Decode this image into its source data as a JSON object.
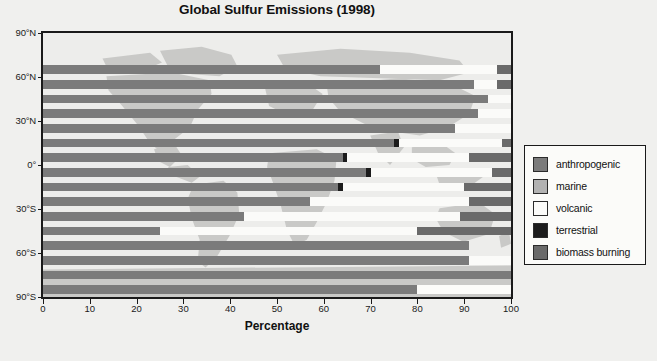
{
  "chart_data": {
    "type": "bar",
    "orientation": "horizontal",
    "stacked": true,
    "title": "Global Sulfur Emissions (1998)",
    "xlabel": "Percentage",
    "ylabel": "",
    "xlim": [
      0,
      100
    ],
    "grid": false,
    "legend_position": "right",
    "xticks": [
      "0",
      "10",
      "20",
      "30",
      "40",
      "50",
      "60",
      "70",
      "80",
      "90",
      "100"
    ],
    "xtick_values": [
      0,
      10,
      20,
      30,
      40,
      50,
      60,
      70,
      80,
      90,
      100
    ],
    "yticks": [
      "90°N",
      "60°N",
      "30°N",
      "0°",
      "30°S",
      "60°S",
      "90°S"
    ],
    "ytick_values": [
      90,
      60,
      30,
      0,
      -30,
      -60,
      -90
    ],
    "categories": [
      "80-90°N",
      "70-80°N",
      "60-70°N",
      "50-60°N",
      "40-50°N",
      "30-40°N",
      "20-30°N",
      "10-20°N",
      "0-10°N",
      "0-10°S",
      "10-20°S",
      "20-30°S",
      "30-40°S",
      "40-50°S",
      "50-60°S",
      "60-70°S",
      "70-80°S",
      "80-90°S"
    ],
    "series": [
      {
        "name": "anthropogenic",
        "color": "#7b7b7b",
        "values": [
          0,
          0,
          72,
          92,
          95,
          93,
          88,
          75,
          64,
          69,
          63,
          57,
          43,
          25,
          0,
          0,
          0,
          0
        ]
      },
      {
        "name": "marine",
        "color": "#b2b2b2",
        "values": [
          0,
          0,
          0,
          0,
          0,
          0,
          0,
          0,
          0,
          0,
          0,
          0,
          0,
          0,
          0,
          0,
          0,
          0
        ]
      },
      {
        "name": "volcanic",
        "color": "#fbfbf9",
        "values": [
          0,
          0,
          25,
          5,
          5,
          7,
          12,
          22,
          26,
          26,
          26,
          34,
          46,
          55,
          0,
          0,
          0,
          0
        ]
      },
      {
        "name": "terrestrial",
        "color": "#1c1c1c",
        "values": [
          0,
          0,
          0,
          0,
          0,
          0,
          0,
          1,
          1,
          1,
          1,
          0,
          0,
          0,
          0,
          0,
          0,
          0
        ]
      },
      {
        "name": "biomass burning",
        "color": "#6a6a6a",
        "values": [
          0,
          0,
          3,
          3,
          0,
          0,
          0,
          2,
          9,
          4,
          10,
          9,
          11,
          20,
          0,
          0,
          0,
          0
        ]
      }
    ],
    "bars": [
      {
        "lat_band": "80-90°N",
        "segments": []
      },
      {
        "lat_band": "70-80°N",
        "segments": [
          {
            "series": "anthropogenic",
            "start": 0,
            "end": 0
          }
        ]
      },
      {
        "lat_band": "60-70°N",
        "segments": [
          {
            "series": "anthropogenic",
            "start": 0,
            "end": 72
          },
          {
            "series": "volcanic",
            "start": 72,
            "end": 97
          },
          {
            "series": "biomass burning",
            "start": 97,
            "end": 100
          }
        ]
      },
      {
        "lat_band": "50-60°N",
        "segments": [
          {
            "series": "anthropogenic",
            "start": 0,
            "end": 92
          },
          {
            "series": "volcanic",
            "start": 92,
            "end": 97
          },
          {
            "series": "biomass burning",
            "start": 97,
            "end": 100
          }
        ]
      },
      {
        "lat_band": "40-50°N",
        "segments": [
          {
            "series": "anthropogenic",
            "start": 0,
            "end": 95
          },
          {
            "series": "volcanic",
            "start": 95,
            "end": 100
          }
        ]
      },
      {
        "lat_band": "30-40°N",
        "segments": [
          {
            "series": "anthropogenic",
            "start": 0,
            "end": 93
          },
          {
            "series": "volcanic",
            "start": 93,
            "end": 100
          }
        ]
      },
      {
        "lat_band": "20-30°N",
        "segments": [
          {
            "series": "anthropogenic",
            "start": 0,
            "end": 88
          },
          {
            "series": "volcanic",
            "start": 88,
            "end": 100
          }
        ]
      },
      {
        "lat_band": "10-20°N",
        "segments": [
          {
            "series": "anthropogenic",
            "start": 0,
            "end": 75
          },
          {
            "series": "terrestrial",
            "start": 75,
            "end": 76
          },
          {
            "series": "volcanic",
            "start": 76,
            "end": 98
          },
          {
            "series": "biomass burning",
            "start": 98,
            "end": 100
          }
        ]
      },
      {
        "lat_band": "0-10°N",
        "segments": [
          {
            "series": "anthropogenic",
            "start": 0,
            "end": 64
          },
          {
            "series": "terrestrial",
            "start": 64,
            "end": 65
          },
          {
            "series": "volcanic",
            "start": 65,
            "end": 91
          },
          {
            "series": "biomass burning",
            "start": 91,
            "end": 100
          }
        ]
      },
      {
        "lat_band": "0-10°S",
        "segments": [
          {
            "series": "anthropogenic",
            "start": 0,
            "end": 69
          },
          {
            "series": "terrestrial",
            "start": 69,
            "end": 70
          },
          {
            "series": "volcanic",
            "start": 70,
            "end": 96
          },
          {
            "series": "biomass burning",
            "start": 96,
            "end": 100
          }
        ]
      },
      {
        "lat_band": "10-20°S",
        "segments": [
          {
            "series": "anthropogenic",
            "start": 0,
            "end": 63
          },
          {
            "series": "terrestrial",
            "start": 63,
            "end": 64
          },
          {
            "series": "volcanic",
            "start": 64,
            "end": 90
          },
          {
            "series": "biomass burning",
            "start": 90,
            "end": 100
          }
        ]
      },
      {
        "lat_band": "20-30°S",
        "segments": [
          {
            "series": "anthropogenic",
            "start": 0,
            "end": 57
          },
          {
            "series": "volcanic",
            "start": 57,
            "end": 91
          },
          {
            "series": "biomass burning",
            "start": 91,
            "end": 100
          }
        ]
      },
      {
        "lat_band": "30-40°S",
        "segments": [
          {
            "series": "anthropogenic",
            "start": 0,
            "end": 43
          },
          {
            "series": "volcanic",
            "start": 43,
            "end": 89
          },
          {
            "series": "biomass burning",
            "start": 89,
            "end": 100
          }
        ]
      },
      {
        "lat_band": "40-50°S",
        "segments": [
          {
            "series": "anthropogenic",
            "start": 0,
            "end": 25
          },
          {
            "series": "volcanic",
            "start": 25,
            "end": 80
          },
          {
            "series": "biomass burning",
            "start": 80,
            "end": 100
          }
        ]
      },
      {
        "lat_band": "50-60°S",
        "segments": [
          {
            "series": "anthropogenic",
            "start": 0,
            "end": 91
          }
        ]
      },
      {
        "lat_band": "60-70°S",
        "segments": [
          {
            "series": "anthropogenic",
            "start": 0,
            "end": 91
          },
          {
            "series": "volcanic",
            "start": 91,
            "end": 100
          }
        ]
      },
      {
        "lat_band": "70-80°S",
        "segments": [
          {
            "series": "anthropogenic",
            "start": 0,
            "end": 100
          }
        ]
      },
      {
        "lat_band": "80-90°S",
        "segments": [
          {
            "series": "anthropogenic",
            "start": 0,
            "end": 80
          },
          {
            "series": "volcanic",
            "start": 80,
            "end": 100
          }
        ]
      }
    ]
  },
  "legend": {
    "items": [
      {
        "label": "anthropogenic",
        "color": "#7b7b7b"
      },
      {
        "label": "marine",
        "color": "#b2b2b2"
      },
      {
        "label": "volcanic",
        "color": "#fbfbf9"
      },
      {
        "label": "terrestrial",
        "color": "#1c1c1c"
      },
      {
        "label": "biomass burning",
        "color": "#6a6a6a"
      }
    ]
  },
  "colors": {
    "background": "#f0f0ee",
    "plot_background": "#fbfbf9",
    "axis": "#1a1a1a",
    "map_land": "#c9c9c7",
    "map_ocean": "#ededeb"
  }
}
